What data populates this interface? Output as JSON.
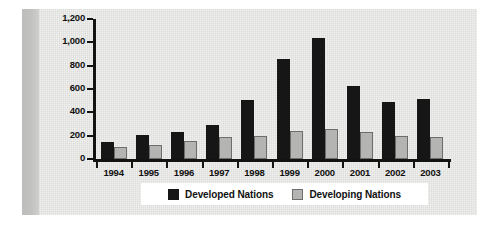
{
  "chart_data": {
    "type": "bar",
    "title": "",
    "subtitle": "",
    "xlabel": "",
    "ylabel": "",
    "categories": [
      "1994",
      "1995",
      "1996",
      "1997",
      "1998",
      "1999",
      "2000",
      "2001",
      "2002",
      "2003"
    ],
    "series": [
      {
        "name": "Developed Nations",
        "color": "#161616",
        "values": [
          145,
          205,
          230,
          290,
          505,
          855,
          1040,
          625,
          490,
          515
        ]
      },
      {
        "name": "Developing Nations",
        "color": "#b4b4b2",
        "values": [
          105,
          120,
          155,
          190,
          200,
          240,
          260,
          235,
          195,
          190
        ]
      }
    ],
    "ylim": [
      0,
      1200
    ],
    "ytick_values": [
      0,
      200,
      400,
      600,
      800,
      1000,
      1200
    ],
    "ytick_labels": [
      "0",
      "200",
      "400",
      "600",
      "800",
      "1,000",
      "1,200"
    ],
    "grid": false,
    "legend_position": "bottom"
  },
  "legend": {
    "entries": [
      {
        "label": "Developed Nations"
      },
      {
        "label": "Developing Nations"
      }
    ]
  }
}
